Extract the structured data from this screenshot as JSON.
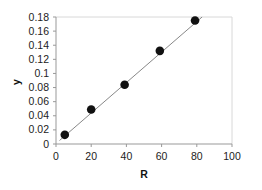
{
  "chart_data": {
    "type": "scatter",
    "title": "",
    "xlabel": "R",
    "ylabel": "y",
    "xlim": [
      0,
      100
    ],
    "ylim": [
      0,
      0.18
    ],
    "x_ticks": [
      "0",
      "20",
      "40",
      "60",
      "80",
      "100"
    ],
    "y_ticks": [
      "0",
      "0.02",
      "0.04",
      "0.06",
      "0.08",
      "0.1",
      "0.12",
      "0.14",
      "0.16",
      "0.18"
    ],
    "grid": false,
    "legend": null,
    "series": [
      {
        "name": "data",
        "marker": "filled-circle",
        "color": "#111111",
        "x": [
          5,
          20,
          39,
          59,
          79
        ],
        "y": [
          0.013,
          0.049,
          0.084,
          0.132,
          0.175
        ]
      },
      {
        "name": "linear fit",
        "type": "line",
        "color": "#888888",
        "x": [
          2,
          83
        ],
        "y": [
          0.005,
          0.18
        ]
      }
    ]
  }
}
